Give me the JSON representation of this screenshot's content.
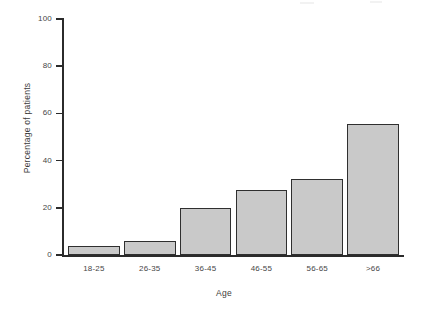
{
  "chart_data": {
    "type": "bar",
    "title": "",
    "xlabel": "Age",
    "ylabel": "Percentage of patients",
    "categories": [
      "18-25",
      "26-35",
      "36-45",
      "46-55",
      "56-65",
      ">66"
    ],
    "values": [
      4,
      6,
      20,
      27.5,
      32,
      55.5
    ],
    "ylim": [
      0,
      100
    ],
    "yticks": [
      0,
      20,
      40,
      60,
      80,
      100
    ],
    "ytick_labels": [
      "0",
      "20",
      "40",
      "60",
      "80",
      "100"
    ],
    "grid": false,
    "legend": null,
    "bar_color": "#c9c9c9",
    "bar_edge_color": "#2f2f2f",
    "axis_color": "#2b2b2b"
  }
}
